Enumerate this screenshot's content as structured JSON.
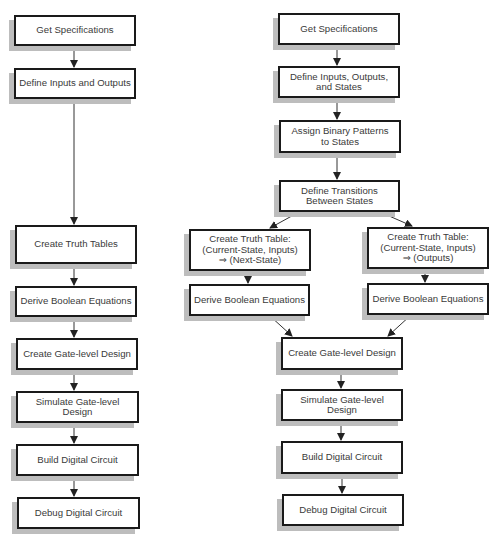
{
  "diagram": {
    "left_flow": {
      "label": "Combinational design flow",
      "boxes": [
        {
          "id": "L1",
          "text": "Get Specifications"
        },
        {
          "id": "L2",
          "text": "Define Inputs and Outputs"
        },
        {
          "id": "L3",
          "text": "Create Truth Tables"
        },
        {
          "id": "L4",
          "text": "Derive Boolean Equations"
        },
        {
          "id": "L5",
          "text": "Create Gate-level Design"
        },
        {
          "id": "L6",
          "text": "Simulate Gate-level Design"
        },
        {
          "id": "L7",
          "text": "Build Digital Circuit"
        },
        {
          "id": "L8",
          "text": "Debug Digital Circuit"
        }
      ]
    },
    "right_flow": {
      "label": "Sequential design flow",
      "boxes": [
        {
          "id": "R1",
          "text": "Get Specifications"
        },
        {
          "id": "R2",
          "text": "Define Inputs, Outputs,\nand States"
        },
        {
          "id": "R3",
          "text": "Assign Binary Patterns\nto States"
        },
        {
          "id": "R4",
          "text": "Define Transitions\nBetween States"
        },
        {
          "id": "R5a",
          "text": "Create Truth Table:\n(Current-State, Inputs)\n⇒  (Next-State)"
        },
        {
          "id": "R5b",
          "text": "Create Truth Table:\n(Current-State, Inputs)\n⇒  (Outputs)"
        },
        {
          "id": "R6a",
          "text": "Derive Boolean Equations"
        },
        {
          "id": "R6b",
          "text": "Derive Boolean Equations"
        },
        {
          "id": "R7",
          "text": "Create Gate-level Design"
        },
        {
          "id": "R8",
          "text": "Simulate Gate-level Design"
        },
        {
          "id": "R9",
          "text": "Build Digital Circuit"
        },
        {
          "id": "R10",
          "text": "Debug Digital Circuit"
        }
      ]
    },
    "edges": [
      [
        "L1",
        "L2"
      ],
      [
        "L2",
        "L3"
      ],
      [
        "L3",
        "L4"
      ],
      [
        "L4",
        "L5"
      ],
      [
        "L5",
        "L6"
      ],
      [
        "L6",
        "L7"
      ],
      [
        "L7",
        "L8"
      ],
      [
        "R1",
        "R2"
      ],
      [
        "R2",
        "R3"
      ],
      [
        "R3",
        "R4"
      ],
      [
        "R4",
        "R5a"
      ],
      [
        "R4",
        "R5b"
      ],
      [
        "R5a",
        "R6a"
      ],
      [
        "R5b",
        "R6b"
      ],
      [
        "R6a",
        "R7"
      ],
      [
        "R6b",
        "R7"
      ],
      [
        "R7",
        "R8"
      ],
      [
        "R8",
        "R9"
      ],
      [
        "R9",
        "R10"
      ]
    ],
    "colors": {
      "box_border": "#1a1a1a",
      "box_shadow": "#bdbdbd",
      "text": "#3a3a3a",
      "arrow": "#222222"
    }
  }
}
